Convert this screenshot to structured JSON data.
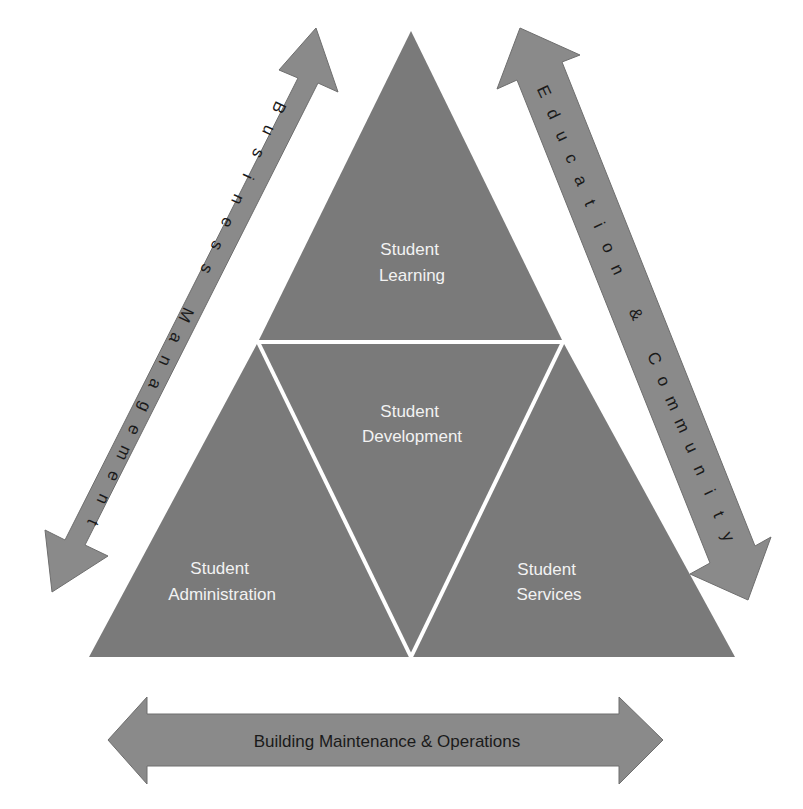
{
  "diagram": {
    "colors": {
      "triangle_fill": "#7a7a7a",
      "arrow_fill": "#8a8a8a",
      "divider": "#ffffff",
      "segment_text": "#f2f2f2",
      "arrow_text": "#1a1a1a",
      "background": "#ffffff"
    },
    "segments": {
      "top": {
        "line1": "Student",
        "line2": "Learning"
      },
      "center": {
        "line1": "Student",
        "line2": "Development"
      },
      "bottom_left": {
        "line1": "Student",
        "line2": "Administration"
      },
      "bottom_right": {
        "line1": "Student",
        "line2": "Services"
      }
    },
    "arrows": {
      "left": {
        "label": "Business Management",
        "orientation": "diagonal, bidirectional, upper-right to lower-left"
      },
      "right": {
        "label": "Education & Community",
        "orientation": "diagonal, bidirectional, upper-left to lower-right"
      },
      "bottom": {
        "label": "Building Maintenance & Operations",
        "orientation": "horizontal, bidirectional"
      }
    }
  }
}
